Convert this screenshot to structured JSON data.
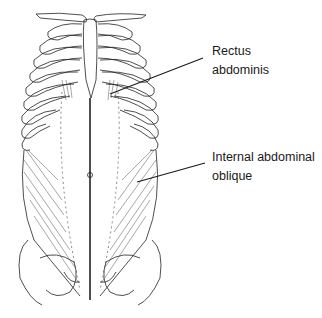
{
  "figure": {
    "labels": [
      {
        "id": "rectus",
        "line1": "Rectus",
        "line2": "abdominis"
      },
      {
        "id": "oblique",
        "line1": "Internal abdominal",
        "line2": "oblique"
      }
    ],
    "colors": {
      "line": "#1a1a1a",
      "background": "#ffffff",
      "muscle_fiber": "#333333"
    }
  }
}
